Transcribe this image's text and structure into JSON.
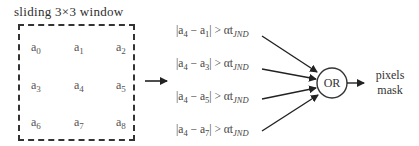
{
  "diagram": {
    "window_title": "sliding 3×3 window",
    "cells": [
      {
        "base": "a",
        "sub": "0"
      },
      {
        "base": "a",
        "sub": "1"
      },
      {
        "base": "a",
        "sub": "2"
      },
      {
        "base": "a",
        "sub": "3"
      },
      {
        "base": "a",
        "sub": "4"
      },
      {
        "base": "a",
        "sub": "5"
      },
      {
        "base": "a",
        "sub": "6"
      },
      {
        "base": "a",
        "sub": "7"
      },
      {
        "base": "a",
        "sub": "8"
      }
    ],
    "conditions": [
      {
        "left": "|a",
        "center_sub": "4",
        "minus": " − a",
        "neighbor_sub": "1",
        "rest": "| > αt",
        "threshold_sub": "JND"
      },
      {
        "left": "|a",
        "center_sub": "4",
        "minus": " − a",
        "neighbor_sub": "3",
        "rest": "| > αt",
        "threshold_sub": "JND"
      },
      {
        "left": "|a",
        "center_sub": "4",
        "minus": " − a",
        "neighbor_sub": "5",
        "rest": "| > αt",
        "threshold_sub": "JND"
      },
      {
        "left": "|a",
        "center_sub": "4",
        "minus": " − a",
        "neighbor_sub": "7",
        "rest": "| > αt",
        "threshold_sub": "JND"
      }
    ],
    "operator": "OR",
    "output_line1": "pixels",
    "output_line2": "mask",
    "colors": {
      "stroke": "#333333",
      "text": "#444444",
      "background": "#ffffff"
    }
  }
}
